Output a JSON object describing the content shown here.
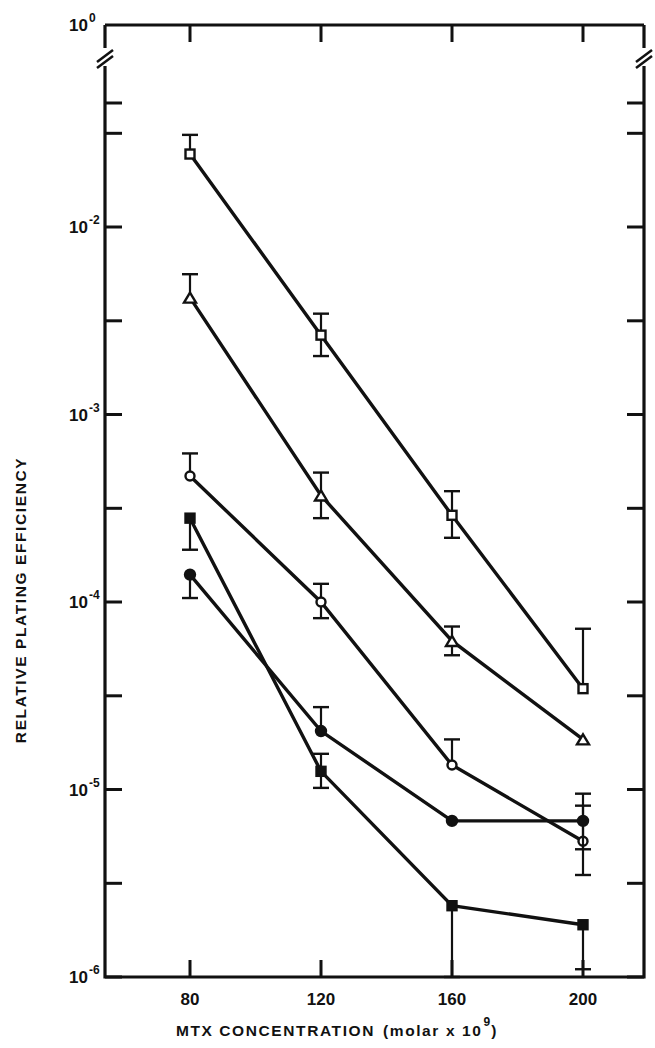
{
  "chart_data": {
    "type": "line",
    "title": "",
    "xlabel": "MTX CONCENTRATION (molar x 10^9)",
    "xlabel_main": "MTX CONCENTRATION",
    "xlabel_paren_open": "(molar x 10",
    "xlabel_exp": "9",
    "xlabel_paren_close": ")",
    "ylabel": "RELATIVE PLATING EFFICIENCY",
    "x": [
      80,
      120,
      160,
      200
    ],
    "xtick_labels": [
      "80",
      "120",
      "160",
      "200"
    ],
    "ytick_labels": [
      "10",
      "10",
      "10",
      "10",
      "10"
    ],
    "ytick_exponents": [
      "0",
      "-2",
      "-3",
      "-4",
      "-5",
      "-6"
    ],
    "ytick_values": [
      1,
      0.01,
      0.001,
      0.0001,
      1e-05,
      1e-06
    ],
    "yscale": "log",
    "ylim": [
      1e-06,
      1
    ],
    "xlim": [
      60,
      215
    ],
    "axis_break": true,
    "grid": false,
    "legend": "none",
    "series": [
      {
        "name": "open-square",
        "marker": "open-square",
        "values": [
          0.0245,
          0.00265,
          0.00029,
          3.45e-05
        ],
        "err_hi": [
          0.031,
          0.00345,
          0.00039,
          7.2e-05
        ],
        "err_lo": [
          0.0245,
          0.00205,
          0.00022,
          3.45e-05
        ]
      },
      {
        "name": "open-triangle",
        "marker": "open-triangle",
        "values": [
          0.0042,
          0.00037,
          6.2e-05,
          1.85e-05
        ],
        "err_hi": [
          0.0056,
          0.00049,
          7.4e-05,
          1.85e-05
        ],
        "err_lo": [
          0.0042,
          0.00028,
          5.2e-05,
          1.85e-05
        ]
      },
      {
        "name": "open-circle",
        "marker": "open-circle",
        "values": [
          0.00047,
          0.0001,
          1.35e-05,
          5.3e-06
        ],
        "err_hi": [
          0.00062,
          0.000125,
          1.85e-05,
          8.2e-06
        ],
        "err_lo": [
          0.00047,
          8.2e-05,
          1.35e-05,
          3.5e-06
        ]
      },
      {
        "name": "filled-square",
        "marker": "filled-square",
        "values": [
          0.00028,
          1.25e-05,
          2.4e-06,
          1.9e-06
        ],
        "err_hi": [
          0.00028,
          1.55e-05,
          2.4e-06,
          1.9e-06
        ],
        "err_lo": [
          0.00019,
          1.02e-05,
          1e-06,
          1.1e-06
        ]
      },
      {
        "name": "filled-circle",
        "marker": "filled-circle",
        "values": [
          0.00014,
          2.05e-05,
          6.8e-06,
          6.8e-06
        ],
        "err_hi": [
          0.00014,
          2.75e-05,
          6.8e-06,
          9.5e-06
        ],
        "err_lo": [
          0.000105,
          2.05e-05,
          6.8e-06,
          4.8e-06
        ]
      }
    ]
  }
}
